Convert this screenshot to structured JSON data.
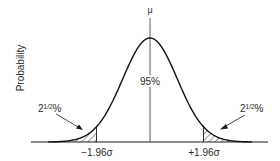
{
  "chart_data": {
    "type": "area",
    "title": "",
    "distribution": "normal",
    "xlabel": "",
    "ylabel": "Probability",
    "mean_label": "μ",
    "center_label": "95%",
    "tail_labels": {
      "left": "2½%",
      "right": "2½%"
    },
    "tick_labels": [
      "−1.96σ",
      "+1.96σ"
    ],
    "critical_values_sigma": [
      -1.96,
      1.96
    ],
    "central_area_percent": 95,
    "tail_area_percent": [
      2.5,
      2.5
    ],
    "shaded_regions": [
      "left tail (x < −1.96σ)",
      "right tail (x > +1.96σ)"
    ],
    "shading_style": "diagonal hatch",
    "grid": false,
    "legend": "none"
  },
  "labels": {
    "ylabel": "Probability",
    "mu": "μ",
    "center": "95%",
    "left_tail_whole": "2",
    "left_tail_frac": "1/2",
    "left_tail_pct": "%",
    "right_tail_whole": "2",
    "right_tail_frac": "1/2",
    "right_tail_pct": "%",
    "left_tick": "−1.96σ",
    "right_tick": "+1.96σ"
  },
  "colors": {
    "ink": "#1a1a1a",
    "background": "#ffffff"
  }
}
